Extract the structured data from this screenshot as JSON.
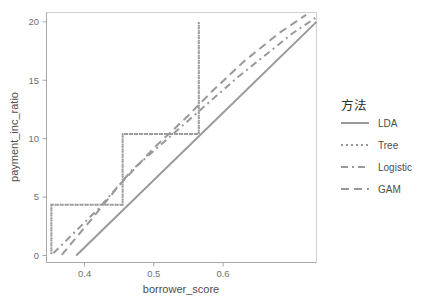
{
  "chart_data": {
    "type": "line",
    "title": "",
    "xlabel": "borrower_score",
    "ylabel": "payment_inc_ratio",
    "xlim": [
      0.345,
      0.735
    ],
    "ylim": [
      -0.6,
      20.8
    ],
    "xticks": [
      0.4,
      0.5,
      0.6
    ],
    "xtick_labels": [
      "0.4",
      "0.5",
      "0.6"
    ],
    "yticks": [
      0,
      5,
      10,
      15,
      20
    ],
    "ytick_labels": [
      "0",
      "5",
      "10",
      "15",
      "20"
    ],
    "grid": false,
    "legend_position": "right",
    "legend_title": "方法",
    "line_color": "#999999",
    "panel_border_color": "#d0d0d0",
    "axis_color": "#a8a8a8",
    "series": [
      {
        "name": "LDA",
        "dash_style": "solid",
        "dasharray": "none",
        "points": [
          [
            0.388,
            0.0
          ],
          [
            0.735,
            20.0
          ]
        ]
      },
      {
        "name": "Tree",
        "dash_style": "dotted",
        "dasharray": "2,3",
        "points": [
          [
            0.352,
            0.1
          ],
          [
            0.352,
            4.35
          ],
          [
            0.455,
            4.35
          ],
          [
            0.455,
            10.4
          ],
          [
            0.565,
            10.4
          ],
          [
            0.565,
            20.0
          ],
          [
            0.565,
            10.4
          ],
          [
            0.455,
            10.4
          ],
          [
            0.455,
            4.35
          ],
          [
            0.352,
            4.35
          ],
          [
            0.352,
            0.1
          ]
        ]
      },
      {
        "name": "Logistic",
        "dash_style": "dashdot",
        "dasharray": "7,4,2,4",
        "points": [
          [
            0.355,
            0.2
          ],
          [
            0.42,
            4.0
          ],
          [
            0.47,
            7.4
          ],
          [
            0.52,
            10.0
          ],
          [
            0.57,
            12.6
          ],
          [
            0.62,
            15.2
          ],
          [
            0.7,
            19.0
          ],
          [
            0.735,
            20.4
          ]
        ]
      },
      {
        "name": "GAM",
        "dash_style": "dashed",
        "dasharray": "8,5",
        "points": [
          [
            0.367,
            0.05
          ],
          [
            0.41,
            3.1
          ],
          [
            0.45,
            6.0
          ],
          [
            0.5,
            9.2
          ],
          [
            0.545,
            11.7
          ],
          [
            0.585,
            14.1
          ],
          [
            0.63,
            16.6
          ],
          [
            0.68,
            19.0
          ],
          [
            0.72,
            20.6
          ]
        ]
      }
    ]
  },
  "legend": {
    "title": "方法",
    "items": [
      {
        "label": "LDA",
        "dasharray": "none"
      },
      {
        "label": "Tree",
        "dasharray": "2,3"
      },
      {
        "label": "Logistic",
        "dasharray": "7,4,2,4"
      },
      {
        "label": "GAM",
        "dasharray": "8,5"
      }
    ]
  }
}
